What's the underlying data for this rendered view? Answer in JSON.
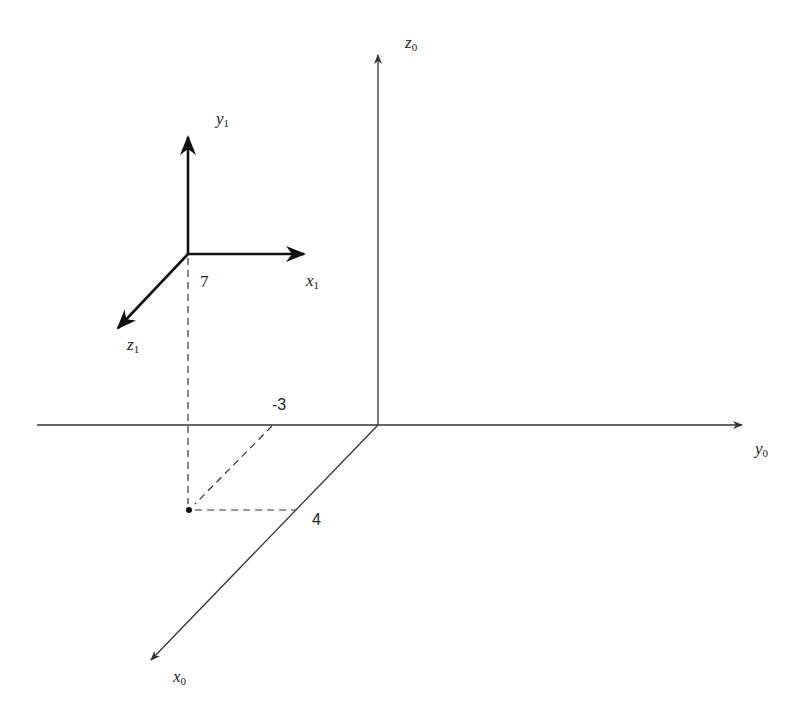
{
  "diagram": {
    "title": "",
    "frame0": {
      "name": "frame 0",
      "axes": [
        {
          "id": "x0",
          "symbol": "x",
          "subscript": "0",
          "direction": "out-of-page (down-left)"
        },
        {
          "id": "y0",
          "symbol": "y",
          "subscript": "0",
          "direction": "right"
        },
        {
          "id": "z0",
          "symbol": "z",
          "subscript": "0",
          "direction": "up"
        }
      ]
    },
    "frame1": {
      "name": "frame 1",
      "axes": [
        {
          "id": "x1",
          "symbol": "x",
          "subscript": "1",
          "direction": "right"
        },
        {
          "id": "y1",
          "symbol": "y",
          "subscript": "1",
          "direction": "up"
        },
        {
          "id": "z1",
          "symbol": "z",
          "subscript": "1",
          "direction": "out-of-page (down-left)"
        }
      ]
    },
    "point": {
      "coordinates_in_frame0": {
        "x": 4,
        "y": -3,
        "z": 7
      },
      "labels": {
        "x": "4",
        "y": "-3",
        "z": "7"
      }
    },
    "colors": {
      "axis": "#333333",
      "frame1_axis": "#111111",
      "dashed": "#333333",
      "background": "#ffffff"
    }
  }
}
